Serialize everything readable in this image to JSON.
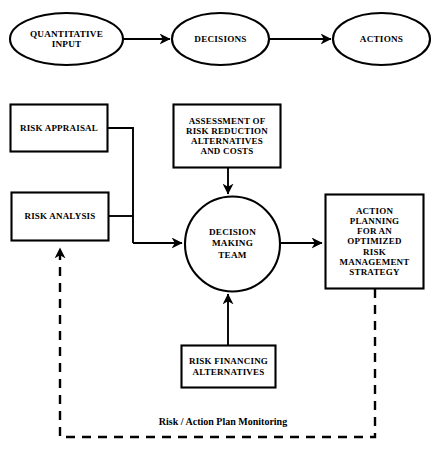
{
  "diagram": {
    "background_color": "#ffffff",
    "line_color": "#000000",
    "text_color": "#000000"
  },
  "flow_top": {
    "nodes": [
      {
        "id": "quantitative-input",
        "shape": "ellipse",
        "label": "QUANTITATIVE\nINPUT"
      },
      {
        "id": "decisions",
        "shape": "ellipse",
        "label": "DECISIONS"
      },
      {
        "id": "actions",
        "shape": "ellipse",
        "label": "ACTIONS"
      }
    ],
    "connectors": [
      {
        "from": "quantitative-input",
        "to": "decisions",
        "style": "solid-arrow"
      },
      {
        "from": "decisions",
        "to": "actions",
        "style": "solid-arrow"
      }
    ]
  },
  "flow_main": {
    "nodes": [
      {
        "id": "risk-appraisal",
        "shape": "rect",
        "label": "RISK APPRAISAL"
      },
      {
        "id": "risk-analysis",
        "shape": "rect",
        "label": "RISK ANALYSIS"
      },
      {
        "id": "assessment",
        "shape": "rect",
        "label": "ASSESSMENT OF\nRISK REDUCTION\nALTERNATIVES\nAND COSTS"
      },
      {
        "id": "decision-making-team",
        "shape": "circle",
        "label": "DECISION\nMAKING\nTEAM"
      },
      {
        "id": "action-planning",
        "shape": "rect",
        "label": "ACTION\nPLANNING\nFOR AN\nOPTIMIZED\nRISK\nMANAGEMENT\nSTRATEGY"
      },
      {
        "id": "risk-financing",
        "shape": "rect",
        "label": "RISK FINANCING\nALTERNATIVES"
      }
    ],
    "connectors": [
      {
        "from": "risk-appraisal",
        "to": "decision-making-team",
        "style": "solid-arrow"
      },
      {
        "from": "risk-analysis",
        "to": "decision-making-team",
        "style": "solid-arrow"
      },
      {
        "from": "assessment",
        "to": "decision-making-team",
        "style": "solid-arrow"
      },
      {
        "from": "risk-financing",
        "to": "decision-making-team",
        "style": "solid-arrow"
      },
      {
        "from": "decision-making-team",
        "to": "action-planning",
        "style": "solid-arrow"
      },
      {
        "from": "action-planning",
        "to": "risk-analysis",
        "style": "dashed-arrow",
        "label": "Risk / Action Plan Monitoring"
      }
    ]
  },
  "feedback": {
    "label": "Risk / Action Plan Monitoring"
  }
}
